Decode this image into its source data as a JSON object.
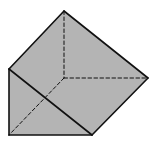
{
  "diagram": {
    "fill_color": "#b4b4b4",
    "edge_color": "#111111",
    "vertices": {
      "top": [
        64,
        11
      ],
      "left_top": [
        9,
        69
      ],
      "right": [
        148,
        78
      ],
      "hidden": [
        64,
        78
      ],
      "bottom_left": [
        9,
        135
      ],
      "bottom_right": [
        92,
        135
      ]
    },
    "faces": [
      {
        "name": "end-triangle",
        "points": "9,69 9,135 92,135"
      },
      {
        "name": "slanted-face",
        "points": "9,69 64,11 148,78 92,135"
      }
    ],
    "visible_edges": [
      {
        "name": "edge-left-vertical",
        "from": "left_top",
        "to": "bottom_left"
      },
      {
        "name": "edge-bottom",
        "from": "bottom_left",
        "to": "bottom_right"
      },
      {
        "name": "edge-front-diagonal",
        "from": "left_top",
        "to": "bottom_right"
      },
      {
        "name": "edge-top-left",
        "from": "left_top",
        "to": "top"
      },
      {
        "name": "edge-top-right",
        "from": "top",
        "to": "right"
      },
      {
        "name": "edge-right-lower",
        "from": "right",
        "to": "bottom_right"
      }
    ],
    "hidden_edges": [
      {
        "name": "hidden-edge-vertical",
        "from": "top",
        "to": "hidden"
      },
      {
        "name": "hidden-edge-horizontal",
        "from": "hidden",
        "to": "right"
      },
      {
        "name": "hidden-edge-diagonal",
        "from": "hidden",
        "to": "bottom_left"
      }
    ]
  }
}
